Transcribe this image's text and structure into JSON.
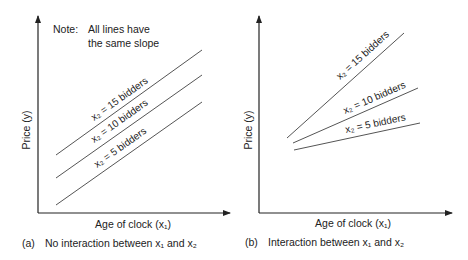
{
  "panel_a": {
    "note_line1": "Note:",
    "note_line2": "All lines have",
    "note_line3": "the same slope",
    "y_label": "Price (y)",
    "x_label": "Age of clock (x₁)",
    "caption_prefix": "(a)",
    "caption": "No interaction between x₁ and x₂",
    "lines": [
      {
        "label": "x₂ = 15 bidders"
      },
      {
        "label": "x₂ = 10 bidders"
      },
      {
        "label": "x₂ = 5 bidders"
      }
    ]
  },
  "panel_b": {
    "y_label": "Price (y)",
    "x_label": "Age of clock (x₁)",
    "caption_prefix": "(b)",
    "caption": "Interaction between x₁ and x₂",
    "lines": [
      {
        "label": "x₂ = 15 bidders"
      },
      {
        "label": "x₂ = 10 bidders"
      },
      {
        "label": "x₂ = 5 bidders"
      }
    ]
  },
  "colors": {
    "axis": "#222222",
    "line": "#555555",
    "text": "#222222"
  }
}
